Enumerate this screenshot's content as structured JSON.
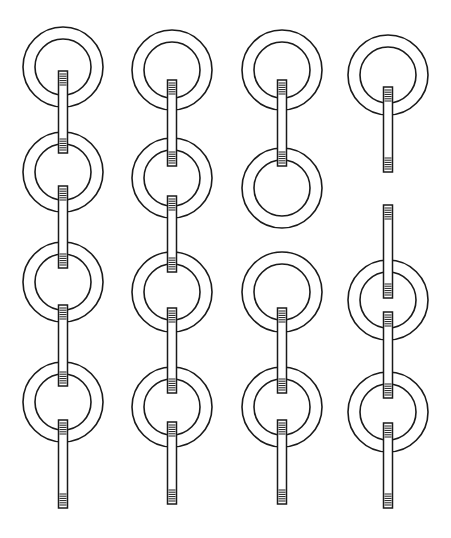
{
  "illustration": {
    "title": "",
    "description": "Line drawing of four vertical chains made of flat rings linked by short threaded rods",
    "colors": {
      "line": "#1a1a1a",
      "background": "#ffffff"
    },
    "ring": {
      "outer_r": 40,
      "inner_r": 28
    },
    "rod": {
      "width": 9
    },
    "columns": [
      {
        "x": 63,
        "rings": [
          67,
          172,
          282,
          402
        ],
        "rods": [
          [
            71,
            153
          ],
          [
            186,
            268
          ],
          [
            305,
            386
          ],
          [
            420,
            508
          ]
        ]
      },
      {
        "x": 172,
        "rings": [
          70,
          178,
          292,
          407
        ],
        "rods": [
          [
            80,
            166
          ],
          [
            196,
            272
          ],
          [
            308,
            393
          ],
          [
            422,
            504
          ]
        ]
      },
      {
        "x": 282,
        "rings": [
          70,
          188,
          292,
          407
        ],
        "rods": [
          [
            80,
            166
          ],
          [
            308,
            393
          ],
          [
            420,
            504
          ]
        ]
      },
      {
        "x": 388,
        "rings": [
          75,
          300,
          412
        ],
        "rods": [
          [
            87,
            172
          ],
          [
            205,
            298
          ],
          [
            312,
            398
          ],
          [
            423,
            508
          ]
        ]
      }
    ]
  }
}
